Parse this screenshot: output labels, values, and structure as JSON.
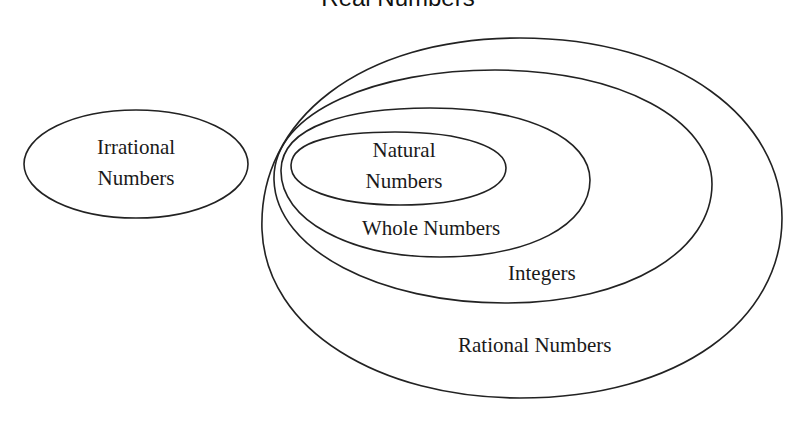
{
  "title": "Real Numbers",
  "sets": {
    "irrational": {
      "line1": "Irrational",
      "line2": "Numbers"
    },
    "natural": {
      "line1": "Natural",
      "line2": "Numbers"
    },
    "whole": {
      "label": "Whole Numbers"
    },
    "integers": {
      "label": "Integers"
    },
    "rational": {
      "label": "Rational Numbers"
    }
  },
  "style": {
    "stroke": "#222222",
    "background": "#ffffff"
  }
}
